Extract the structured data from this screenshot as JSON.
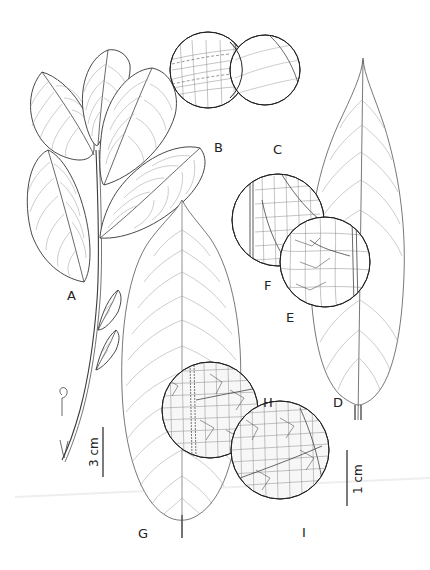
{
  "figure": {
    "type": "botanical-illustration",
    "panel_labels": {
      "A": "A",
      "B": "B",
      "C": "C",
      "D": "D",
      "E": "E",
      "F": "F",
      "G": "G",
      "H": "H",
      "I": "I"
    },
    "scale_bars": {
      "large": "3 cm",
      "small": "1 cm"
    },
    "panels": [
      {
        "id": "A",
        "content": "leafy branch with alternate elliptic leaves"
      },
      {
        "id": "B",
        "content": "detail circle of leaf venation (upper surface)"
      },
      {
        "id": "C",
        "content": "detail circle of leaf surface"
      },
      {
        "id": "D",
        "content": "narrow elliptic leaf with acuminate tip"
      },
      {
        "id": "E",
        "content": "detail circle of reticulate venation"
      },
      {
        "id": "F",
        "content": "detail circle of tertiary venation near margin"
      },
      {
        "id": "G",
        "content": "large oblong-elliptic leaf"
      },
      {
        "id": "H",
        "content": "detail circle of dense reticulate venation with midrib"
      },
      {
        "id": "I",
        "content": "detail circle of dense areolate venation"
      }
    ]
  }
}
